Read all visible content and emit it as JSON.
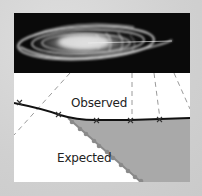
{
  "figure": {
    "type": "galaxy rotation curve diagram",
    "top_panel": {
      "content": "spiral galaxy image (edge-on tilted)",
      "background": "#0a0a0a"
    },
    "bottom_panel": {
      "background": "#ffffff",
      "curves": [
        {
          "name": "Observed",
          "label": "Observed",
          "style": "solid line with x markers",
          "color": "#111111",
          "points": [
            [
              0,
              30
            ],
            [
              46,
              42
            ],
            [
              82,
              47
            ],
            [
              116,
              47
            ],
            [
              146,
              46
            ],
            [
              176,
              45
            ]
          ]
        },
        {
          "name": "Expected",
          "label": "Expected",
          "style": "dotted line with round markers",
          "color": "#888888",
          "points": [
            [
              54,
              45
            ],
            [
              127,
              109
            ]
          ]
        }
      ],
      "shaded_region": {
        "description": "difference between observed and expected",
        "color": "#a9a9a9"
      },
      "guide_lines": "dashed projection lines from galaxy to curve"
    }
  },
  "colors": {
    "background": "#d5d5d5",
    "shade": "#a9a9a9",
    "line": "#111111",
    "dots": "#8a8a8a",
    "dashes": "#9a9a9a"
  }
}
